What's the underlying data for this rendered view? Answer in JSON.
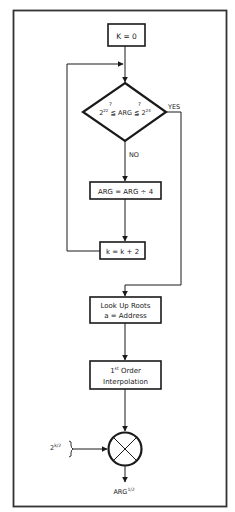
{
  "diagram": {
    "type": "flowchart",
    "title": "",
    "nodes": {
      "init": {
        "label": "K = 0"
      },
      "decision": {
        "base_low": "2",
        "exp_low": "22",
        "cmp_low": "≦",
        "q_low": "?",
        "middle": "ARG",
        "cmp_high": "≦",
        "q_high": "?",
        "base_high": "2",
        "exp_high": "24"
      },
      "divide": {
        "label": "ARG = ARG ÷ 4"
      },
      "increment": {
        "label": "k = k + 2"
      },
      "lookup": {
        "line1": "Look Up Roots",
        "line2": "a = Address"
      },
      "interp": {
        "line1_num": "1",
        "line1_sup": "st",
        "line1_rest": " Order",
        "line2": "Interpolation"
      },
      "multiplier": {
        "symbol": "multiply-circle"
      }
    },
    "edge_labels": {
      "yes": "YES",
      "no": "NO"
    },
    "input": {
      "base": "2",
      "exp": "k/2"
    },
    "output": {
      "base": "ARG",
      "exp": "1/2"
    },
    "colors": {
      "stroke": "#1a1a1a",
      "frame": "#333333",
      "background": "#ffffff"
    }
  }
}
